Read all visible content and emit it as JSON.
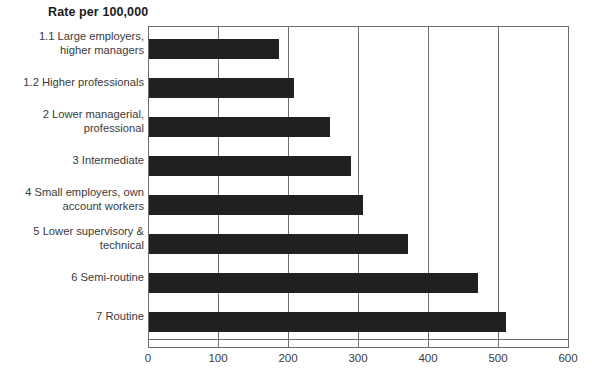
{
  "chart_data": {
    "type": "bar",
    "orientation": "horizontal",
    "title": "Rate per 100,000",
    "xlabel": "",
    "ylabel": "",
    "xlim": [
      0,
      600
    ],
    "xticks": [
      0,
      100,
      200,
      300,
      400,
      500,
      600
    ],
    "xtick_labels": [
      "0",
      "100",
      "200",
      "300",
      "400",
      "500",
      "600"
    ],
    "grid": true,
    "grid_axis": "x",
    "legend": "none",
    "bar_color": "#221f1f",
    "categories": [
      "1.1 Large employers,\nhigher managers",
      "1.2 Higher professionals",
      "2 Lower managerial,\nprofessional",
      "3 Intermediate",
      "4 Small employers, own\naccount workers",
      "5 Lower supervisory &\ntechnical",
      "6 Semi-routine",
      "7 Routine"
    ],
    "values": [
      185,
      207,
      258,
      288,
      305,
      370,
      470,
      510
    ]
  },
  "figure": {
    "background_color": "#ffffff",
    "axis_color": "#6e6e6e",
    "text_color": "#3a3a3a"
  }
}
